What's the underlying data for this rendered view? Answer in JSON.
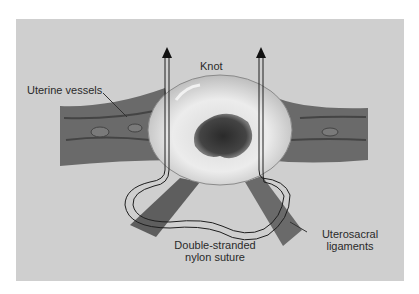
{
  "diagram": {
    "labels": {
      "uterine_vessels": "Uterine vessels",
      "knot": "Knot",
      "suture_line1": "Double-stranded",
      "suture_line2": "nylon suture",
      "ligaments_line1": "Uterosacral",
      "ligaments_line2": "ligaments"
    },
    "colors": {
      "background": "#cfcfcf",
      "tissue": "#6e6e6e",
      "cervix": "#e6e6e6",
      "os": "#3a3a3a",
      "suture": "#1e1e1e"
    }
  }
}
